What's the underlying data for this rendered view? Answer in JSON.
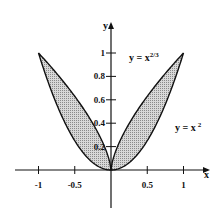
{
  "chart_data": {
    "type": "area",
    "title": "",
    "xlabel": "x",
    "ylabel": "y",
    "xlim": [
      -1.3,
      1.3
    ],
    "ylim": [
      -0.35,
      1.2
    ],
    "x_ticks": [
      -1,
      -0.5,
      0.5,
      1
    ],
    "x_tick_labels": [
      "-1",
      "-0.5",
      "0.5",
      "1"
    ],
    "y_ticks": [
      0.2,
      0.4,
      0.6,
      0.8,
      1
    ],
    "y_tick_labels": [
      "0.2",
      "0.4",
      "0.6",
      "0.8",
      "1"
    ],
    "grid": false,
    "series": [
      {
        "name": "y = x^(2/3)",
        "formula": "x^(2/3)",
        "domain": [
          -1,
          1
        ]
      },
      {
        "name": "y = x^2",
        "formula": "x^2",
        "domain": [
          -1,
          1
        ]
      }
    ],
    "shaded_region": "between y = x^2 and y = x^(2/3) for -1 <= x <= 1",
    "annotations": [
      {
        "text": "y = x",
        "sup": "2/3",
        "position": "upper right near curve x^(2/3)"
      },
      {
        "text": "y = x",
        "sup": "2",
        "position": "right, below first label"
      }
    ]
  },
  "labels": {
    "x_axis": "x",
    "y_axis": "y",
    "curve1_base": "y = x",
    "curve1_sup": "2/3",
    "curve2_base": "y = x",
    "curve2_sup": "2"
  }
}
